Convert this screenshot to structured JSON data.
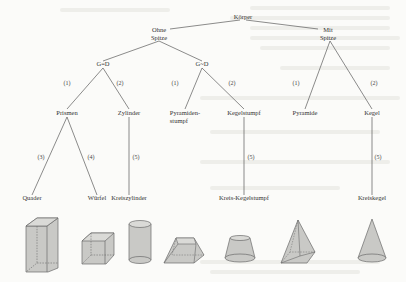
{
  "diagram": {
    "root": {
      "id": "koerper",
      "label": "Körper",
      "children": [
        {
          "id": "ohne-spitze",
          "label": "Ohne\nSpitze",
          "children": [
            {
              "id": "g-gleich-d",
              "label": "G=D",
              "children": [
                {
                  "id": "prismen",
                  "edge": "(1)",
                  "label": "Prismen",
                  "children": [
                    {
                      "id": "quader",
                      "edge": "(3)",
                      "label": "Quader"
                    },
                    {
                      "id": "wuerfel",
                      "edge": "(4)",
                      "label": "Würfel"
                    }
                  ]
                },
                {
                  "id": "zylinder",
                  "edge": "(2)",
                  "label": "Zylinder",
                  "children": [
                    {
                      "id": "kreiszylinder",
                      "edge": "(5)",
                      "label": "Kreiszylinder"
                    }
                  ]
                }
              ]
            },
            {
              "id": "g-aehnlich-d",
              "label": "G~D",
              "children": [
                {
                  "id": "pyramidenstumpf",
                  "edge": "(1)",
                  "label": "Pyramiden-\nstumpf"
                },
                {
                  "id": "kegelstumpf",
                  "edge": "(2)",
                  "label": "Kegelstumpf",
                  "children": [
                    {
                      "id": "kreis-kegelstumpf",
                      "edge": "(5)",
                      "label": "Kreis-Kegelstumpf"
                    }
                  ]
                }
              ]
            }
          ]
        },
        {
          "id": "mit-spitze",
          "label": "Mit\nSpitze",
          "children": [
            {
              "id": "pyramide",
              "edge": "(1)",
              "label": "Pyramide"
            },
            {
              "id": "kegel",
              "edge": "(2)",
              "label": "Kegel",
              "children": [
                {
                  "id": "kreiskegel",
                  "edge": "(5)",
                  "label": "Kreiskegel"
                }
              ]
            }
          ]
        }
      ]
    },
    "shapes": [
      {
        "name": "quader",
        "kind": "cuboid"
      },
      {
        "name": "wuerfel",
        "kind": "cube"
      },
      {
        "name": "kreiszylinder",
        "kind": "cylinder"
      },
      {
        "name": "pyramidenstumpf",
        "kind": "frustum-pyramid"
      },
      {
        "name": "kegelstumpf",
        "kind": "frustum-cone"
      },
      {
        "name": "pyramide",
        "kind": "pyramid"
      },
      {
        "name": "kegel",
        "kind": "cone"
      }
    ],
    "colors": {
      "line": "#5a5a5a",
      "shape_fill": "#c9c9c6",
      "shape_stroke": "#6a6a6a",
      "text": "#333333"
    }
  }
}
